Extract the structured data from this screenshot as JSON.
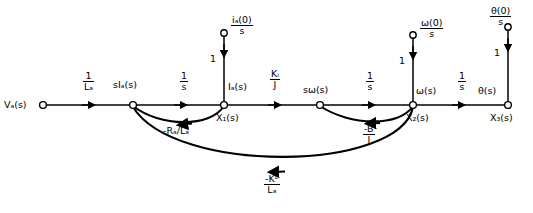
{
  "diagram": {
    "type": "signal-flow-graph",
    "stroke_color": "#000000",
    "background_color": "#ffffff"
  },
  "nodes": [
    {
      "id": "va",
      "name": "node-va",
      "label": "V",
      "sub": "a",
      "suffix": "(s)",
      "x": 43,
      "y": 105,
      "label_pos": "left",
      "state": ""
    },
    {
      "id": "sia",
      "name": "node-sia",
      "label": "sI",
      "sub": "a",
      "suffix": "(s)",
      "x": 133,
      "y": 105,
      "label_pos": "above",
      "state": ""
    },
    {
      "id": "x1",
      "name": "node-x1",
      "label": "I",
      "sub": "a",
      "suffix": "(s)",
      "x": 224,
      "y": 105,
      "label_pos": "above-right",
      "state": "X₁(s)"
    },
    {
      "id": "sw",
      "name": "node-sw",
      "label": "sω",
      "sub": "",
      "suffix": "(s)",
      "x": 320,
      "y": 105,
      "label_pos": "above",
      "state": ""
    },
    {
      "id": "x2",
      "name": "node-x2",
      "label": "ω",
      "sub": "",
      "suffix": "(s)",
      "x": 413,
      "y": 105,
      "label_pos": "above-right",
      "state": "X₂(s)"
    },
    {
      "id": "x3",
      "name": "node-x3",
      "label": "θ",
      "sub": "",
      "suffix": "(s)",
      "x": 508,
      "y": 105,
      "label_pos": "above-left",
      "state": "X₃(s)"
    },
    {
      "id": "src1",
      "name": "node-source-ia0",
      "label": "",
      "sub": "",
      "suffix": "",
      "x": 224,
      "y": 33,
      "label_pos": "right",
      "state": ""
    },
    {
      "id": "src2",
      "name": "node-source-w0",
      "label": "",
      "sub": "",
      "suffix": "",
      "x": 413,
      "y": 35,
      "label_pos": "right",
      "state": ""
    },
    {
      "id": "src3",
      "name": "node-source-th0",
      "label": "",
      "sub": "",
      "suffix": "",
      "x": 508,
      "y": 27,
      "label_pos": "right",
      "state": ""
    }
  ],
  "node_labels": {
    "va": "Vₐ(s)",
    "sia": "sIₐ(s)",
    "ia": "Iₐ(s)",
    "x1": "X₁(s)",
    "sw": "sω(s)",
    "w": "ω(s)",
    "x2": "X₂(s)",
    "th": "θ(s)",
    "x3": "X₃(s)"
  },
  "sources": [
    {
      "name": "source-ia0",
      "num": "iₐ(0)",
      "den": "s",
      "gain": "1",
      "x": 224,
      "top_y": 33
    },
    {
      "name": "source-w0",
      "num": "ω(0)",
      "den": "s",
      "gain": "1",
      "x": 413,
      "top_y": 35
    },
    {
      "name": "source-th0",
      "num": "θ(0)",
      "den": "s",
      "gain": "1",
      "x": 508,
      "top_y": 27
    }
  ],
  "forward_branches": [
    {
      "name": "branch-va-to-sia",
      "from": "va",
      "to": "sia",
      "gain_num": "1",
      "gain_den": "Lₐ",
      "label_x": 88,
      "label_y": 74
    },
    {
      "name": "branch-sia-to-x1",
      "from": "sia",
      "to": "x1",
      "gain_num": "1",
      "gain_den": "s",
      "label_x": 184,
      "label_y": 74
    },
    {
      "name": "branch-x1-to-sw",
      "from": "x1",
      "to": "sw",
      "gain_num": "Kᵢ",
      "gain_den": "J",
      "label_x": 274,
      "label_y": 72
    },
    {
      "name": "branch-sw-to-x2",
      "from": "sw",
      "to": "x2",
      "gain_num": "1",
      "gain_den": "s",
      "label_x": 370,
      "label_y": 74
    },
    {
      "name": "branch-x2-to-x3",
      "from": "x2",
      "to": "x3",
      "gain_num": "1",
      "gain_den": "s",
      "label_x": 462,
      "label_y": 74
    }
  ],
  "feedback_branches": [
    {
      "name": "feedback-ra-la",
      "from": "x1",
      "to": "sia",
      "gain": "-Rₐ/Lₐ",
      "label_x": 183,
      "label_y": 130,
      "style": "inline"
    },
    {
      "name": "feedback-b-j",
      "from": "x2",
      "to": "sw",
      "gain_num": "-B",
      "gain_den": "J",
      "label_x": 370,
      "label_y": 128,
      "style": "fraction"
    },
    {
      "name": "feedback-kb-la",
      "from": "x2",
      "to": "sia",
      "gain_num": "-Kᵇ",
      "gain_den": "Lₐ",
      "label_x": 272,
      "label_y": 178,
      "style": "fraction"
    }
  ],
  "unit_gain_labels": [
    {
      "name": "unit-gain-1",
      "text": "1",
      "x": 211,
      "y": 58
    },
    {
      "name": "unit-gain-2",
      "text": "1",
      "x": 400,
      "y": 60
    },
    {
      "name": "unit-gain-3",
      "text": "1",
      "x": 495,
      "y": 52
    }
  ]
}
